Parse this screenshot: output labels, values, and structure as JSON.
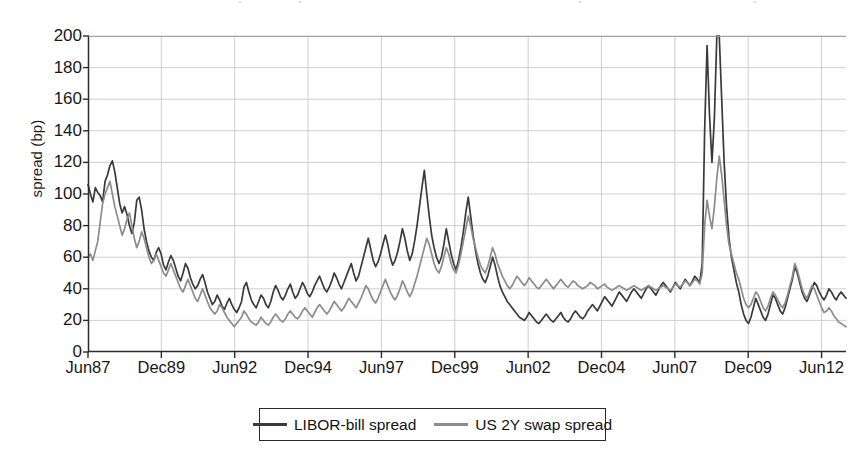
{
  "chart_data": {
    "type": "line",
    "title": "",
    "xlabel": "",
    "ylabel": "spread (bp)",
    "ylim": [
      0,
      200
    ],
    "ytick_values": [
      0,
      20,
      40,
      60,
      80,
      100,
      120,
      140,
      160,
      180,
      200
    ],
    "ytick_labels": [
      "0",
      "20",
      "40",
      "60",
      "80",
      "100",
      "120",
      "140",
      "160",
      "180",
      "200"
    ],
    "xtick_labels": [
      "Jun87",
      "Dec89",
      "Jun92",
      "Dec94",
      "Jun97",
      "Dec99",
      "Jun02",
      "Dec04",
      "Jun07",
      "Dec09",
      "Jun12"
    ],
    "xtick_positions": [
      0,
      30,
      60,
      90,
      120,
      150,
      180,
      210,
      240,
      270,
      300
    ],
    "xlim": [
      0,
      310
    ],
    "x_unit": "months since Jun 1987",
    "grid": true,
    "grid_color": "#c9c9c9",
    "legend_position": "below-center",
    "series": [
      {
        "name": "LIBOR-bill spread",
        "color": "#3a3a3a",
        "values": [
          106,
          100,
          95,
          104,
          101,
          99,
          95,
          108,
          112,
          118,
          121,
          114,
          104,
          94,
          88,
          92,
          87,
          80,
          75,
          82,
          96,
          98,
          90,
          78,
          70,
          64,
          60,
          58,
          63,
          66,
          62,
          55,
          52,
          57,
          61,
          58,
          53,
          48,
          45,
          50,
          56,
          53,
          47,
          43,
          40,
          42,
          46,
          49,
          44,
          38,
          34,
          30,
          32,
          36,
          33,
          29,
          27,
          31,
          34,
          30,
          27,
          25,
          28,
          32,
          41,
          44,
          38,
          33,
          30,
          28,
          32,
          36,
          34,
          30,
          28,
          32,
          38,
          42,
          39,
          35,
          33,
          36,
          40,
          43,
          38,
          34,
          36,
          40,
          44,
          41,
          37,
          35,
          38,
          42,
          45,
          48,
          44,
          40,
          38,
          41,
          45,
          50,
          47,
          43,
          40,
          44,
          48,
          52,
          56,
          50,
          45,
          48,
          54,
          60,
          66,
          72,
          65,
          58,
          54,
          57,
          62,
          68,
          74,
          68,
          60,
          55,
          58,
          63,
          70,
          78,
          72,
          64,
          58,
          62,
          70,
          80,
          92,
          104,
          115,
          100,
          86,
          74,
          66,
          60,
          56,
          60,
          68,
          78,
          70,
          62,
          56,
          52,
          58,
          66,
          76,
          88,
          98,
          86,
          74,
          64,
          56,
          50,
          46,
          44,
          48,
          54,
          60,
          55,
          48,
          42,
          38,
          35,
          32,
          30,
          28,
          26,
          24,
          22,
          21,
          20,
          22,
          25,
          23,
          21,
          19,
          18,
          20,
          22,
          24,
          22,
          20,
          19,
          21,
          23,
          25,
          22,
          20,
          19,
          21,
          24,
          26,
          24,
          22,
          21,
          23,
          26,
          28,
          30,
          28,
          26,
          29,
          32,
          35,
          33,
          31,
          29,
          32,
          35,
          38,
          36,
          34,
          32,
          35,
          38,
          40,
          38,
          36,
          34,
          37,
          40,
          42,
          40,
          38,
          36,
          39,
          42,
          44,
          42,
          40,
          38,
          41,
          44,
          42,
          40,
          43,
          46,
          44,
          42,
          45,
          48,
          46,
          44,
          56,
          140,
          194,
          150,
          120,
          148,
          200,
          200,
          160,
          120,
          92,
          72,
          60,
          52,
          44,
          38,
          30,
          24,
          20,
          18,
          22,
          28,
          34,
          30,
          26,
          22,
          20,
          24,
          30,
          36,
          34,
          30,
          26,
          24,
          28,
          34,
          40,
          46,
          54,
          50,
          44,
          38,
          34,
          32,
          36,
          40,
          44,
          42,
          38,
          35,
          33,
          36,
          40,
          38,
          35,
          33,
          36,
          38,
          36,
          34
        ]
      },
      {
        "name": "US 2Y swap spread",
        "color": "#8c8c8c",
        "values": [
          60,
          62,
          58,
          64,
          70,
          82,
          94,
          100,
          104,
          108,
          100,
          92,
          86,
          80,
          74,
          78,
          84,
          88,
          80,
          72,
          66,
          70,
          76,
          72,
          66,
          60,
          56,
          58,
          62,
          58,
          54,
          50,
          48,
          52,
          56,
          52,
          48,
          44,
          40,
          38,
          42,
          46,
          42,
          38,
          34,
          32,
          36,
          40,
          36,
          32,
          28,
          26,
          24,
          26,
          30,
          28,
          25,
          22,
          20,
          18,
          16,
          18,
          20,
          22,
          26,
          24,
          21,
          19,
          18,
          17,
          19,
          22,
          20,
          18,
          17,
          19,
          22,
          24,
          22,
          20,
          19,
          21,
          24,
          26,
          24,
          22,
          21,
          23,
          26,
          28,
          26,
          24,
          22,
          25,
          28,
          30,
          28,
          26,
          24,
          26,
          29,
          32,
          30,
          28,
          26,
          28,
          31,
          34,
          32,
          30,
          28,
          31,
          34,
          38,
          42,
          40,
          36,
          33,
          31,
          34,
          38,
          42,
          46,
          42,
          38,
          35,
          33,
          36,
          40,
          45,
          42,
          38,
          35,
          38,
          43,
          48,
          54,
          60,
          66,
          72,
          68,
          62,
          56,
          52,
          50,
          54,
          60,
          66,
          62,
          56,
          52,
          50,
          55,
          62,
          70,
          78,
          86,
          80,
          72,
          66,
          60,
          55,
          52,
          50,
          54,
          60,
          66,
          62,
          56,
          52,
          48,
          45,
          42,
          40,
          42,
          45,
          48,
          46,
          44,
          42,
          44,
          47,
          45,
          43,
          41,
          40,
          42,
          44,
          46,
          44,
          42,
          40,
          42,
          44,
          46,
          44,
          42,
          41,
          43,
          45,
          44,
          42,
          41,
          40,
          41,
          42,
          44,
          43,
          42,
          40,
          41,
          42,
          43,
          41,
          40,
          39,
          40,
          41,
          42,
          41,
          40,
          39,
          40,
          41,
          42,
          41,
          40,
          39,
          40,
          41,
          42,
          41,
          40,
          39,
          40,
          41,
          42,
          41,
          40,
          39,
          41,
          43,
          42,
          41,
          43,
          45,
          44,
          42,
          44,
          46,
          45,
          43,
          50,
          80,
          96,
          86,
          78,
          92,
          110,
          124,
          112,
          96,
          80,
          68,
          62,
          56,
          50,
          46,
          40,
          34,
          30,
          28,
          30,
          34,
          38,
          36,
          32,
          28,
          26,
          29,
          34,
          38,
          36,
          33,
          30,
          28,
          31,
          36,
          42,
          48,
          56,
          52,
          46,
          40,
          36,
          34,
          38,
          42,
          40,
          36,
          32,
          28,
          25,
          26,
          28,
          26,
          23,
          21,
          19,
          18,
          17,
          16
        ]
      }
    ]
  },
  "legend": {
    "entries": [
      {
        "label": "LIBOR-bill spread",
        "style": "dark"
      },
      {
        "label": "US 2Y swap spread",
        "style": "gray"
      }
    ]
  },
  "axes": {
    "y_title": "spread (bp)"
  }
}
